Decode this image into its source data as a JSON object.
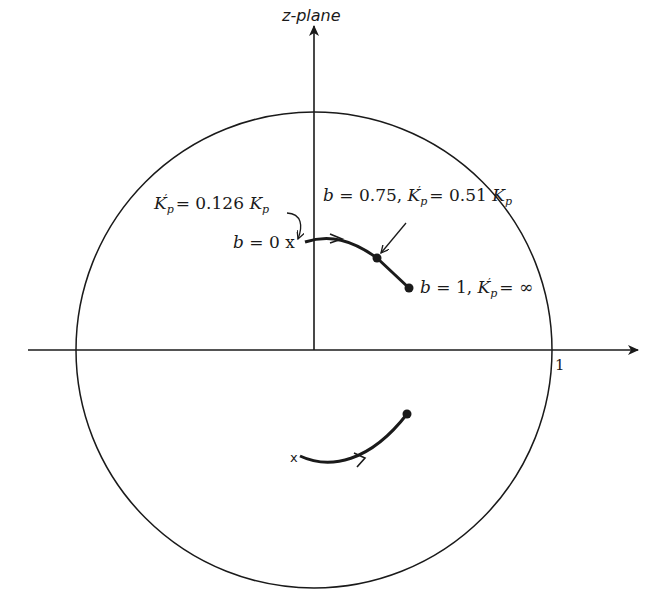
{
  "title": "z-plane",
  "axis": {
    "unit_tick_label": "1"
  },
  "annotations": {
    "gain_at_start": {
      "lhs": "K",
      "sub": "p",
      "prime": "′",
      "eq": " = 0.126 ",
      "rhs": "K",
      "rhs_sub": "p"
    },
    "start_point": {
      "var": "b",
      "text": " = 0 x"
    },
    "mid_point": {
      "var": "b",
      "text": " = 0.75,  ",
      "lhs": "K",
      "sub": "p",
      "prime": "′",
      "eq": " = 0.51 ",
      "rhs": "K",
      "rhs_sub": "p"
    },
    "end_point": {
      "var": "b",
      "text": " = 1, ",
      "lhs": "K",
      "sub": "p",
      "prime": "′",
      "eq": " = ∞"
    }
  },
  "geometry": {
    "unit_circle": {
      "cx": 314,
      "cy": 350,
      "r": 238
    },
    "upper_locus": {
      "start": [
        305,
        242
      ],
      "mid_dot": [
        377,
        258
      ],
      "end_dot": [
        409,
        288
      ]
    },
    "lower_locus": {
      "start": [
        300,
        458
      ],
      "end_dot": [
        407,
        414
      ]
    }
  },
  "colors": {
    "ink": "#1a1a1a",
    "background": "#ffffff"
  }
}
